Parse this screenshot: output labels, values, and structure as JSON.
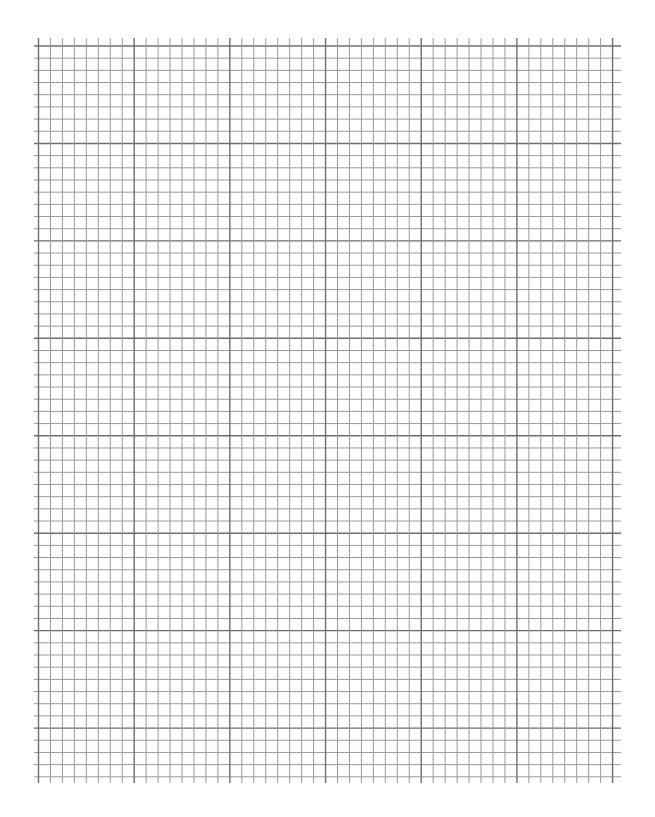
{
  "page": {
    "kind": "blank graph paper",
    "width": 655,
    "height": 817,
    "background_color": "#ffffff"
  },
  "grid": {
    "vertical_lines": {
      "count": 49,
      "x_start": 38.5,
      "spacing": 11.96,
      "y_top": 38,
      "y_bottom": 783
    },
    "horizontal_lines": {
      "count": 61,
      "y_start": 46,
      "spacing": 12.18,
      "x_left": 34,
      "x_right": 621
    },
    "major_every": 8,
    "minor_color": "#9a9a9a",
    "major_color": "#6e6e6e",
    "minor_width": 1,
    "major_width": 1.4,
    "cells_horizontal": 48,
    "cells_vertical": 60
  }
}
